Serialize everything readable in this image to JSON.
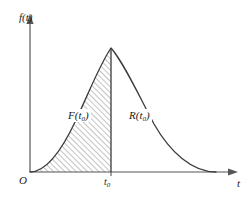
{
  "figure": {
    "type": "diagram",
    "axes": {
      "y_label": "f(t)",
      "x_label": "t",
      "origin_label": "O",
      "y_axis_arrow": "up-arrow-icon",
      "x_axis_arrow": "right-arrow-icon"
    },
    "ticks": {
      "x": [
        {
          "label_base": "t",
          "label_sub": "0",
          "value": "t0"
        }
      ]
    },
    "regions": [
      {
        "name": "cumulative-region",
        "label_base": "F(t",
        "label_sub": "0",
        "label_close": ")",
        "fill": "diagonal-hatch",
        "hatch_color": "#9a9a9a",
        "background": "#ffffff"
      },
      {
        "name": "reliability-region",
        "label_base": "R(t",
        "label_sub": "0",
        "label_close": ")",
        "fill": "none",
        "background": "#ffffff"
      }
    ],
    "curve": {
      "name": "density-curve",
      "stroke": "#3a3a3a",
      "stroke_width": 1.2,
      "start_point": [
        30,
        172
      ],
      "peak_point": [
        111,
        48
      ],
      "end_point": [
        216,
        172
      ]
    },
    "divider": {
      "name": "t0-vertical-line",
      "x": 111,
      "from_y": 48,
      "to_y": 172,
      "stroke": "#3a3a3a"
    },
    "colors": {
      "axis": "#4a4a4a",
      "curve": "#3a3a3a",
      "hatch": "#9a9a9a",
      "text": "#1a1a1a",
      "background": "#ffffff"
    }
  }
}
